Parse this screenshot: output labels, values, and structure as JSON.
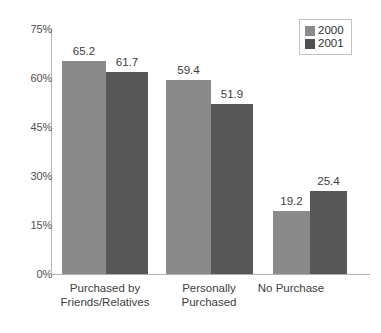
{
  "chart_data": {
    "type": "bar",
    "title": "",
    "subtitle": "",
    "xlabel": "",
    "ylabel": "",
    "categories": [
      "Purchased by\nFriends/Relatives",
      "Personally\nPurchased",
      "No Purchase"
    ],
    "category_lines": [
      [
        "Purchased by",
        "Friends/Relatives"
      ],
      [
        "Personally",
        "Purchased"
      ],
      [
        "No Purchase"
      ]
    ],
    "series": [
      {
        "name": "2000",
        "color": "#8a8a8a",
        "values": [
          65.2,
          59.4,
          19.2
        ]
      },
      {
        "name": "2001",
        "color": "#575757",
        "values": [
          61.7,
          51.9,
          25.4
        ]
      }
    ],
    "value_labels": [
      [
        "65.2",
        "61.7"
      ],
      [
        "59.4",
        "51.9"
      ],
      [
        "19.2",
        "25.4"
      ]
    ],
    "ylim": [
      0,
      75
    ],
    "yticks": [
      0,
      15,
      30,
      45,
      60,
      75
    ],
    "ytick_labels": [
      "0%",
      "15%",
      "30%",
      "45%",
      "60%",
      "75%"
    ],
    "grid": false,
    "legend_position": "top-right",
    "legend_entries": [
      "2000",
      "2001"
    ]
  }
}
